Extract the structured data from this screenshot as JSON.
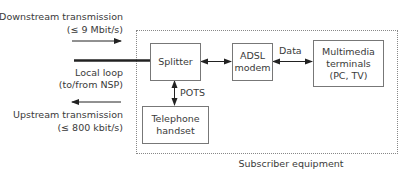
{
  "left_labels": {
    "downstream_title": "Downstream transmission",
    "downstream_rate": "(≤ 9 Mbit/s)",
    "local_loop_title": "Local loop",
    "local_loop_sub": "(to/from NSP)",
    "upstream_title": "Upstream transmission",
    "upstream_rate": "(≤ 800 kbit/s)"
  },
  "boxes": {
    "splitter": "Splitter",
    "adsl_modem_line1": "ADSL",
    "adsl_modem_line2": "modem",
    "multimedia_line1": "Multimedia",
    "multimedia_line2": "terminals",
    "multimedia_line3": "(PC, TV)",
    "telephone_line1": "Telephone",
    "telephone_line2": "handset"
  },
  "connection_labels": {
    "data": "Data",
    "pots": "POTS"
  },
  "frame_caption": "Subscriber equipment",
  "colors": {
    "line": "#222222",
    "box_border": "#777777",
    "frame_border": "#888888",
    "text": "#3a3a3a"
  }
}
